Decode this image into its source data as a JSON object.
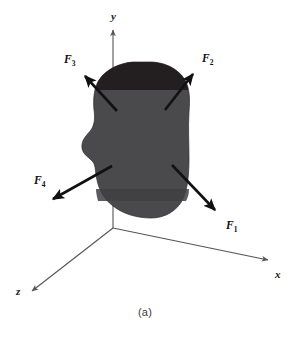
{
  "figure": {
    "caption": "(a)",
    "background_color": "#ffffff"
  },
  "axes": {
    "color": "#555555",
    "origin": {
      "x": 113,
      "y": 228
    },
    "items": [
      {
        "name": "y",
        "label": "y",
        "label_x": 111,
        "label_y": 20,
        "from_x": 113,
        "from_y": 228,
        "to_x": 113,
        "to_y": 30
      },
      {
        "name": "x",
        "label": "x",
        "label_x": 275,
        "label_y": 278,
        "from_x": 113,
        "from_y": 228,
        "to_x": 270,
        "to_y": 261
      },
      {
        "name": "z",
        "label": "z",
        "label_x": 16,
        "label_y": 295,
        "from_x": 113,
        "from_y": 228,
        "to_x": 30,
        "to_y": 293
      }
    ]
  },
  "body_shape": {
    "name": "rigid-body-blob",
    "fill_top": "#231f20",
    "fill_main": "#4a4a4c",
    "fill_lower_band": "#3f3f42",
    "outline": "#2b2b2d"
  },
  "forces": {
    "color": "#111111",
    "items": [
      {
        "id": "F1",
        "base": "F",
        "subscript": "1",
        "tail_x": 172,
        "tail_y": 165,
        "tip_x": 219,
        "tip_y": 214,
        "label_x": 226,
        "label_y": 229
      },
      {
        "id": "F2",
        "base": "F",
        "subscript": "2",
        "tail_x": 165,
        "tail_y": 110,
        "tip_x": 196,
        "tip_y": 70,
        "label_x": 202,
        "label_y": 62
      },
      {
        "id": "F3",
        "base": "F",
        "subscript": "3",
        "tail_x": 117,
        "tail_y": 111,
        "tip_x": 81,
        "tip_y": 72,
        "label_x": 64,
        "label_y": 63
      },
      {
        "id": "F4",
        "base": "F",
        "subscript": "4",
        "tail_x": 112,
        "tail_y": 166,
        "tip_x": 48,
        "tip_y": 202,
        "label_x": 34,
        "label_y": 184
      }
    ]
  }
}
